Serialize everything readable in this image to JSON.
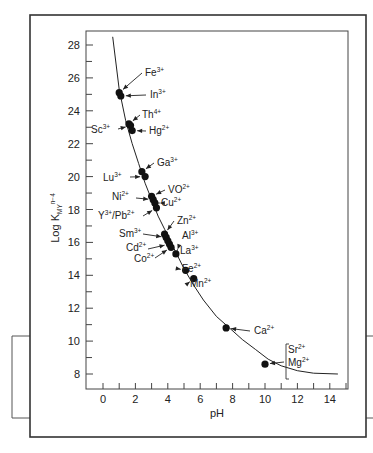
{
  "chart_data": {
    "type": "scatter",
    "title": "",
    "xlabel": "pH",
    "ylabel": "Log K",
    "ylabel_subscript": "MY",
    "ylabel_superscript": "n−4",
    "xlim": [
      -1,
      15
    ],
    "ylim": [
      7,
      29
    ],
    "xticks": [
      0,
      2,
      4,
      6,
      8,
      10,
      12,
      14
    ],
    "yticks": [
      8,
      10,
      12,
      14,
      16,
      18,
      20,
      22,
      24,
      26,
      28
    ],
    "grid": false,
    "legend": "none",
    "curve": {
      "name": "minimum pH curve",
      "x": [
        0.6,
        1.0,
        1.4,
        1.8,
        2.2,
        2.6,
        3.0,
        3.4,
        3.8,
        4.2,
        4.6,
        5.0,
        5.6,
        6.2,
        7.0,
        7.8,
        8.6,
        9.4,
        10.2,
        11.0,
        12.0,
        13.0,
        14.5
      ],
      "y": [
        28.5,
        25.3,
        23.4,
        22.0,
        20.8,
        19.6,
        18.6,
        17.6,
        16.8,
        16.0,
        15.2,
        14.4,
        13.4,
        12.5,
        11.5,
        10.8,
        10.1,
        9.5,
        8.9,
        8.5,
        8.2,
        8.05,
        8.0
      ]
    },
    "points": [
      {
        "ion": "Fe",
        "charge": "3+",
        "x": 1.0,
        "y": 25.1,
        "label_side": "right"
      },
      {
        "ion": "In",
        "charge": "3+",
        "x": 1.1,
        "y": 24.9,
        "label_side": "right"
      },
      {
        "ion": "Th",
        "charge": "4+",
        "x": 1.6,
        "y": 23.2,
        "label_side": "right"
      },
      {
        "ion": "Sc",
        "charge": "3+",
        "x": 1.7,
        "y": 23.1,
        "label_side": "left"
      },
      {
        "ion": "Hg",
        "charge": "2+",
        "x": 1.8,
        "y": 22.8,
        "label_side": "right"
      },
      {
        "ion": "Ga",
        "charge": "3+",
        "x": 2.4,
        "y": 20.3,
        "label_side": "right"
      },
      {
        "ion": "Lu",
        "charge": "3+",
        "x": 2.6,
        "y": 20.0,
        "label_side": "left"
      },
      {
        "ion": "VO",
        "charge": "2+",
        "x": 3.0,
        "y": 18.8,
        "label_side": "right"
      },
      {
        "ion": "Ni",
        "charge": "2+",
        "x": 3.1,
        "y": 18.6,
        "label_side": "left"
      },
      {
        "ion": "Cu",
        "charge": "2+",
        "x": 3.2,
        "y": 18.4,
        "label_side": "right"
      },
      {
        "ion": "Y/Pb",
        "charge": "3+/2+",
        "x": 3.3,
        "y": 18.1,
        "label_side": "left"
      },
      {
        "ion": "Zn",
        "charge": "2+",
        "x": 3.8,
        "y": 16.5,
        "label_side": "right"
      },
      {
        "ion": "Sm",
        "charge": "3+",
        "x": 3.9,
        "y": 16.3,
        "label_side": "left"
      },
      {
        "ion": "Al",
        "charge": "3+",
        "x": 4.0,
        "y": 16.1,
        "label_side": "right"
      },
      {
        "ion": "Cd",
        "charge": "2+",
        "x": 4.1,
        "y": 15.9,
        "label_side": "left"
      },
      {
        "ion": "Co",
        "charge": "2+",
        "x": 4.2,
        "y": 15.7,
        "label_side": "left"
      },
      {
        "ion": "La",
        "charge": "3+",
        "x": 4.5,
        "y": 15.3,
        "label_side": "right"
      },
      {
        "ion": "Fe",
        "charge": "2+",
        "x": 5.1,
        "y": 14.3,
        "label_side": "right"
      },
      {
        "ion": "Mn",
        "charge": "2+",
        "x": 5.6,
        "y": 13.8,
        "label_side": "right"
      },
      {
        "ion": "Ca",
        "charge": "2+",
        "x": 7.6,
        "y": 10.8,
        "label_side": "right"
      },
      {
        "ion": "Sr/Mg",
        "charge": "2+",
        "x": 10.0,
        "y": 8.6,
        "label_side": "right"
      }
    ],
    "annotations": [
      {
        "text": "Fe",
        "sup": "3+"
      },
      {
        "text": "In",
        "sup": "3+"
      },
      {
        "text": "Th",
        "sup": "4+"
      },
      {
        "text": "Sc",
        "sup": "3+"
      },
      {
        "text": "Hg",
        "sup": "2+"
      },
      {
        "text": "Ga",
        "sup": "3+"
      },
      {
        "text": "Lu",
        "sup": "3+"
      },
      {
        "text": "VO",
        "sup": "2+"
      },
      {
        "text": "Ni",
        "sup": "2+"
      },
      {
        "text": "Cu",
        "sup": "2+"
      },
      {
        "text": "Y",
        "sup": "3+",
        "text2": "/Pb",
        "sup2": "2+"
      },
      {
        "text": "Zn",
        "sup": "2+"
      },
      {
        "text": "Sm",
        "sup": "3+"
      },
      {
        "text": "Al",
        "sup": "3+"
      },
      {
        "text": "Cd",
        "sup": "2+"
      },
      {
        "text": "Co",
        "sup": "2+"
      },
      {
        "text": "La",
        "sup": "3+"
      },
      {
        "text": "Fe",
        "sup": "2+"
      },
      {
        "text": "Mn",
        "sup": "2+"
      },
      {
        "text": "Ca",
        "sup": "2+"
      },
      {
        "text": "Sr",
        "sup": "2+"
      },
      {
        "text": "Mg",
        "sup": "2+"
      }
    ]
  }
}
